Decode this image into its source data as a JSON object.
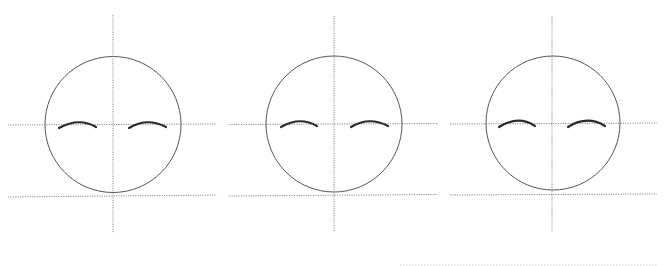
{
  "diagram": {
    "title": "",
    "colors": {
      "background": "#ffffff",
      "guide": "#8a8a8a",
      "head_outline": "#555555",
      "brow": "#2a2a2a"
    },
    "faces": [
      {
        "id": "face-1",
        "circle": {
          "cx": 113,
          "cy": 124.5,
          "r": 68
        },
        "vertical_guide": {
          "x": 113,
          "y1": 15,
          "y2": 233
        },
        "eye_guide": {
          "x1": 8,
          "x2": 217,
          "y1": 125,
          "y2": 124
        },
        "chin_guide": {
          "x1": 8,
          "x2": 217,
          "y1": 197,
          "y2": 195
        },
        "brows": [
          {
            "x1": 59,
            "y1": 128,
            "cx": 79,
            "cy": 117,
            "x2": 96,
            "y2": 127
          },
          {
            "x1": 129,
            "y1": 128,
            "cx": 147,
            "cy": 117,
            "x2": 166,
            "y2": 127
          }
        ]
      },
      {
        "id": "face-2",
        "circle": {
          "cx": 334,
          "cy": 124,
          "r": 68
        },
        "vertical_guide": {
          "x": 334,
          "y1": 16,
          "y2": 231
        },
        "eye_guide": {
          "x1": 229,
          "x2": 438,
          "y1": 124.5,
          "y2": 123.5
        },
        "chin_guide": {
          "x1": 229,
          "x2": 438,
          "y1": 196,
          "y2": 194.5
        },
        "brows": [
          {
            "x1": 281,
            "y1": 127,
            "cx": 300,
            "cy": 116,
            "x2": 317,
            "y2": 126
          },
          {
            "x1": 351,
            "y1": 127,
            "cx": 369,
            "cy": 116,
            "x2": 388,
            "y2": 126
          }
        ]
      },
      {
        "id": "face-3",
        "circle": {
          "cx": 553,
          "cy": 123,
          "r": 67
        },
        "vertical_guide": {
          "x": 552,
          "y1": 16,
          "y2": 231
        },
        "eye_guide": {
          "x1": 450,
          "x2": 657,
          "y1": 124,
          "y2": 123
        },
        "chin_guide": {
          "x1": 450,
          "x2": 657,
          "y1": 195,
          "y2": 194
        },
        "brows": [
          {
            "x1": 499,
            "y1": 127,
            "cx": 518,
            "cy": 115,
            "x2": 535,
            "y2": 126
          },
          {
            "x1": 568,
            "y1": 127,
            "cx": 587,
            "cy": 115,
            "x2": 605,
            "y2": 126
          }
        ]
      }
    ],
    "footer_line": {
      "x1": 400,
      "x2": 657,
      "y": 265
    }
  }
}
